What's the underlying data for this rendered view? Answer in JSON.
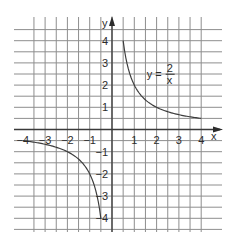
{
  "chart_data": {
    "type": "line",
    "title": "",
    "xlabel": "x",
    "ylabel": "y",
    "xlim": [
      -4.5,
      4.5
    ],
    "ylim": [
      -4.5,
      4.9
    ],
    "grid": true,
    "grid_step": 0.5,
    "x_ticks": [
      -4,
      -3,
      -2,
      -1,
      1,
      2,
      3,
      4
    ],
    "x_tick_labels": [
      "−4",
      "−3",
      "−2",
      "−1",
      "1",
      "2",
      "3",
      "4"
    ],
    "y_ticks": [
      4,
      3,
      2,
      1,
      -1,
      -2,
      -3,
      -4
    ],
    "y_tick_labels": [
      "4",
      "3",
      "2",
      "1",
      "−1",
      "−2",
      "−3",
      "−4"
    ],
    "series": [
      {
        "name": "y = 2/x (x > 0)",
        "function": "y = 2/x",
        "x": [
          0.5,
          0.75,
          1,
          1.5,
          2,
          2.5,
          3,
          3.5,
          4
        ],
        "y": [
          4,
          2.67,
          2,
          1.33,
          1,
          0.8,
          0.67,
          0.57,
          0.5
        ]
      },
      {
        "name": "y = 2/x (x < 0)",
        "function": "y = 2/x",
        "x": [
          -4,
          -3.5,
          -3,
          -2.5,
          -2,
          -1.5,
          -1,
          -0.75,
          -0.5
        ],
        "y": [
          -0.5,
          -0.57,
          -0.67,
          -0.8,
          -1,
          -1.33,
          -2,
          -2.67,
          -4
        ]
      }
    ],
    "annotations": [
      {
        "text_lhs": "y =",
        "numerator": "2",
        "denominator": "x",
        "x": 1.6,
        "y": 2.4
      }
    ]
  },
  "axes": {
    "x_label": "x",
    "y_label": "y"
  },
  "equation": {
    "lhs": "y =",
    "numerator": "2",
    "denominator": "x"
  },
  "colors": {
    "grid": "#8e8e8e",
    "axis": "#3a3a3a",
    "curve": "#3c3c3c",
    "background": "#ffffff"
  }
}
